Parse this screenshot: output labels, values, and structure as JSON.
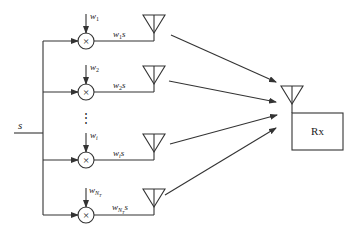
{
  "diagram": {
    "input_label": "s",
    "dots": "⋮",
    "multiplier_symbol": "×",
    "receiver_label": "Rx",
    "branches": [
      {
        "weight": "w",
        "weight_sub": "1",
        "output": "w",
        "output_sub": "1",
        "output_suffix": "s"
      },
      {
        "weight": "w",
        "weight_sub": "2",
        "output": "w",
        "output_sub": "2",
        "output_suffix": "s"
      },
      {
        "weight": "w",
        "weight_sub": "i",
        "output": "w",
        "output_sub": "i",
        "output_suffix": "s"
      },
      {
        "weight": "w",
        "weight_sub": "N",
        "weight_subsub": "T",
        "output": "w",
        "output_sub": "N",
        "output_subsub": "T",
        "output_suffix": "s"
      }
    ],
    "colors": {
      "stroke": "#333333",
      "background": "#ffffff"
    }
  }
}
